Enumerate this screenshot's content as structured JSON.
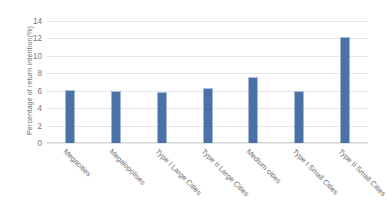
{
  "chart_data": {
    "type": "bar",
    "title": "",
    "xlabel": "",
    "ylabel": "Percentage of return intention(%)",
    "categories": [
      "Megacities",
      "Megalopolises",
      "Type I Large Cities",
      "Type II Large Cities",
      "Medium cities",
      "Type I Small Cities",
      "Type II Small Cities"
    ],
    "values": [
      6.0,
      5.9,
      5.7,
      6.2,
      7.5,
      5.8,
      12.0
    ],
    "ylim": [
      0,
      14
    ],
    "yticks": [
      0,
      2,
      4,
      6,
      8,
      10,
      12,
      14
    ],
    "ytick_labels": [
      "0",
      "2",
      "4",
      "6",
      "8",
      "10",
      "12",
      "14"
    ],
    "grid": true,
    "legend": false,
    "series_color": "#4a72a8",
    "gridline_color": "#e6e6e6",
    "text_color": "#6f6f6f",
    "background": "#ffffff"
  }
}
